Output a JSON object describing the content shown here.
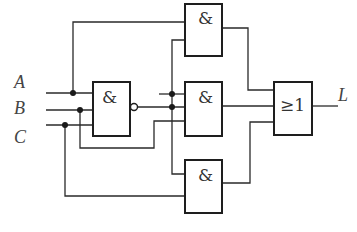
{
  "diagram": {
    "type": "logic-circuit",
    "inputs": [
      {
        "name": "A"
      },
      {
        "name": "B"
      },
      {
        "name": "C"
      }
    ],
    "output": {
      "name": "L"
    },
    "gates": {
      "nand1": {
        "symbol": "&",
        "inverted_output": true
      },
      "and_top": {
        "symbol": "&"
      },
      "and_mid": {
        "symbol": "&"
      },
      "and_bottom": {
        "symbol": "&"
      },
      "or_gate": {
        "symbol": "≥1"
      }
    },
    "connections": [
      "A,B,C -> NAND1",
      "A, NAND1 -> AND_top",
      "A, NAND1, B -> AND_mid",
      "NAND1, C -> AND_bottom",
      "AND_top, AND_mid, AND_bottom -> OR -> L"
    ]
  }
}
